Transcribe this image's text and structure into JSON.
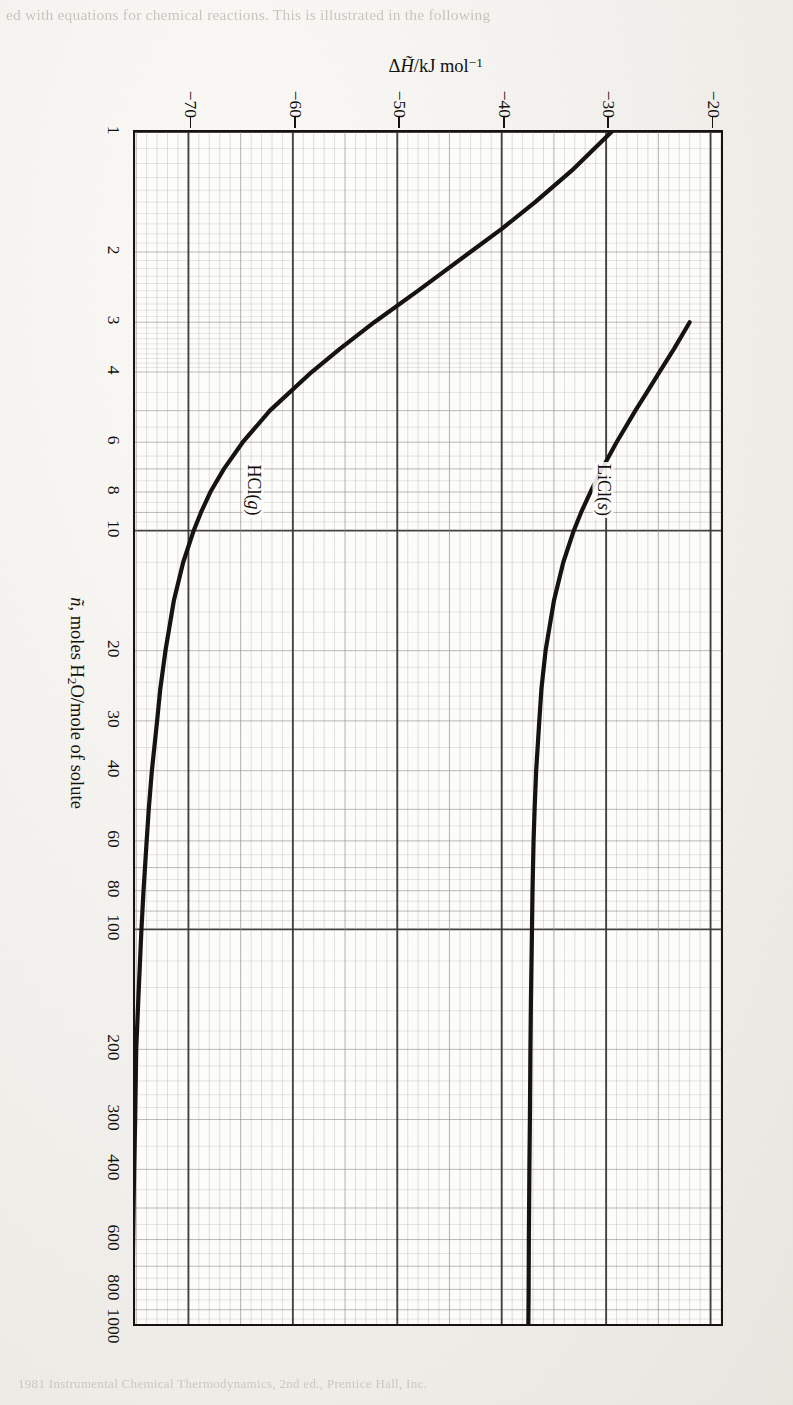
{
  "page": {
    "ghost_text_top": "ed with equations for chemical reactions.  This is illustrated in the following",
    "ghost_text_bottom": "1981 Instrumental Chemical Thermodynamics, 2nd ed., Prentice Hall, Inc."
  },
  "axes": {
    "x_title_prefix": "n",
    "x_title_rest": ", moles H",
    "x_title_sub": "2",
    "x_title_tail": "O/mole of solute",
    "y_title_delta": "Δ",
    "y_title_h": "H",
    "y_title_rest": "/kJ mol",
    "y_title_sup": "−1",
    "x_ticks": [
      "1",
      "2",
      "3",
      "4",
      "6",
      "8",
      "10",
      "20",
      "30",
      "40",
      "60",
      "80",
      "100",
      "200",
      "300",
      "400",
      "600",
      "800",
      "1000"
    ],
    "y_ticks": [
      "-20",
      "-30",
      "-40",
      "-50",
      "-60",
      "-70"
    ],
    "x_min": 1,
    "x_max": 1000,
    "y_min": -75.5,
    "y_max": -19.0,
    "x_scale": "log",
    "y_scale": "linear"
  },
  "annotations": [
    {
      "name": "hcl-curve-label",
      "text": "HCl(g)",
      "x": 8.0,
      "y": -64.0
    },
    {
      "name": "licl-curve-label",
      "text": "LiCl(s)",
      "x": 8.0,
      "y": -30.5
    }
  ],
  "colors": {
    "ink": "#15120f",
    "grid_minor": "#8e8a84",
    "grid_major": "#3b3833",
    "paper": "#fdfdfb",
    "page": "#f2f0ec"
  },
  "chart_data": {
    "type": "line",
    "title": "",
    "xlabel": "ñ, moles H2O/mole of solute",
    "ylabel": "ΔH̃/kJ mol⁻¹",
    "xscale": "log",
    "xlim": [
      1,
      1000
    ],
    "ylim": [
      -75.5,
      -19.0
    ],
    "grid": true,
    "legend": "inline-labels",
    "series": [
      {
        "name": "HCl(g)",
        "x": [
          1,
          1.25,
          1.5,
          1.75,
          2,
          2.5,
          3,
          3.5,
          4,
          5,
          6,
          7,
          8,
          9,
          10,
          12,
          15,
          20,
          25,
          30,
          40,
          50,
          60,
          80,
          100,
          150,
          200,
          300,
          400,
          600,
          800,
          1000
        ],
        "y": [
          -29.5,
          -33.3,
          -36.8,
          -40.0,
          -43.0,
          -48.0,
          -52.2,
          -55.5,
          -58.2,
          -62.2,
          -64.8,
          -66.6,
          -67.9,
          -68.8,
          -69.5,
          -70.5,
          -71.4,
          -72.2,
          -72.7,
          -73.0,
          -73.5,
          -73.8,
          -74.0,
          -74.3,
          -74.5,
          -74.8,
          -75.0,
          -75.1,
          -75.2,
          -75.3,
          -75.35,
          -75.4
        ]
      },
      {
        "name": "LiCl(s)",
        "x": [
          3,
          3.5,
          4,
          4.5,
          5,
          6,
          7,
          8,
          9,
          10,
          12,
          15,
          20,
          25,
          30,
          40,
          50,
          60,
          80,
          100,
          150,
          200,
          300,
          400,
          600,
          800,
          1000
        ],
        "y": [
          -22.0,
          -23.5,
          -24.9,
          -26.1,
          -27.2,
          -29.0,
          -30.4,
          -31.5,
          -32.4,
          -33.1,
          -34.1,
          -35.0,
          -35.8,
          -36.2,
          -36.4,
          -36.7,
          -36.85,
          -36.95,
          -37.05,
          -37.1,
          -37.2,
          -37.25,
          -37.3,
          -37.35,
          -37.4,
          -37.42,
          -37.45
        ]
      }
    ]
  }
}
